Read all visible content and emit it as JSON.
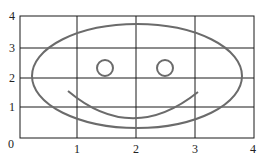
{
  "diagram": {
    "type": "grid-drawing",
    "x_ticks": [
      "0",
      "1",
      "2",
      "3",
      "4"
    ],
    "y_ticks": [
      "0",
      "1",
      "2",
      "3",
      "4"
    ],
    "grid": {
      "x_range": [
        0,
        4
      ],
      "y_range": [
        0,
        4
      ]
    },
    "shapes": {
      "face": {
        "shape": "ellipse",
        "center": [
          2,
          2.05
        ],
        "rx": 1.75,
        "ry": 1.7
      },
      "left_eye": {
        "shape": "circle",
        "center": [
          1.5,
          2.3
        ],
        "r": 0.15
      },
      "right_eye": {
        "shape": "circle",
        "center": [
          2.5,
          2.3
        ],
        "r": 0.15
      },
      "mouth": {
        "shape": "arc",
        "from": [
          0.85,
          1.55
        ],
        "to": [
          3.05,
          1.5
        ],
        "lowest": [
          2,
          0.65
        ]
      }
    },
    "colors": {
      "grid": "#1a1a1a",
      "shape": "#6b6b6b"
    }
  }
}
